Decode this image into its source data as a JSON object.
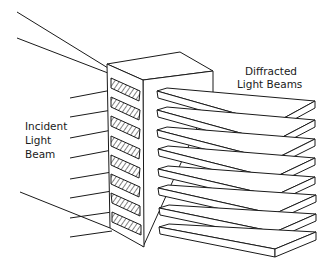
{
  "diagram": {
    "type": "illustration",
    "labels": {
      "incident_line1": "Incident",
      "incident_line2": "Light",
      "incident_line3": "Beam",
      "diffracted_line1": "Diffracted",
      "diffracted_line2": "Light Beams"
    },
    "slot_count": 8,
    "beam_count": 8,
    "colors": {
      "ink": "#1a1a1a",
      "background": "#ffffff"
    }
  }
}
